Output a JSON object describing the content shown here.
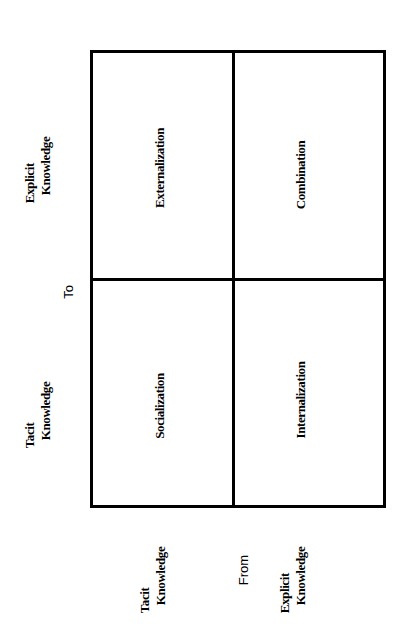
{
  "diagram": {
    "orientation": "rotated -90deg",
    "line_color": "#000000",
    "background_color": "#ffffff",
    "to_axis": {
      "title": "To",
      "labels": [
        {
          "line1": "Explicit",
          "line2": "Knowledge"
        },
        {
          "line1": "Tacit",
          "line2": "Knowledge"
        }
      ]
    },
    "from_axis": {
      "title": "From",
      "labels": [
        {
          "line1": "Tacit",
          "line2": "Knowledge"
        },
        {
          "line1": "Explicit",
          "line2": "Knowledge"
        }
      ]
    },
    "cells": {
      "top_left": "Externalization",
      "top_right": "Combination",
      "bottom_left": "Socialization",
      "bottom_right": "Internalization"
    }
  }
}
